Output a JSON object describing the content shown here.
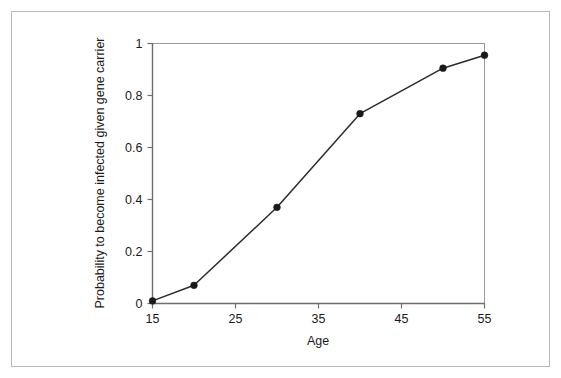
{
  "figure": {
    "background_color": "#ffffff",
    "frame_color": "#b9b9b9",
    "axis_color": "#6e6e6e",
    "spine_color": "#9a9a9a",
    "series_color": "#2b2b2b",
    "marker_color": "#1a1a1a",
    "text_color": "#1a1a1a"
  },
  "chart_data": {
    "type": "line",
    "title": "",
    "subtitle": "",
    "xlabel": "Age",
    "ylabel": "Probability to become infected given gene carrier",
    "xlim": [
      15,
      55
    ],
    "ylim": [
      0,
      1
    ],
    "xticks": [
      15,
      25,
      35,
      45,
      55
    ],
    "xtick_labels": [
      "15",
      "25",
      "35",
      "45",
      "55"
    ],
    "yticks": [
      0,
      0.2,
      0.4,
      0.6,
      0.8,
      1
    ],
    "ytick_labels": [
      "0",
      "0.2",
      "0.4",
      "0.6",
      "0.8",
      "1"
    ],
    "grid": false,
    "legend": null,
    "legend_position": "none",
    "marker": "filled-circle",
    "line_style": "solid",
    "x": [
      15,
      20,
      30,
      40,
      50,
      55
    ],
    "y": [
      0.01,
      0.07,
      0.37,
      0.73,
      0.905,
      0.955
    ],
    "series": [
      {
        "name": "Probability to become infected given gene carrier",
        "x": [
          15,
          20,
          30,
          40,
          50,
          55
        ],
        "values": [
          0.01,
          0.07,
          0.37,
          0.73,
          0.905,
          0.955
        ]
      }
    ],
    "annotations": []
  }
}
